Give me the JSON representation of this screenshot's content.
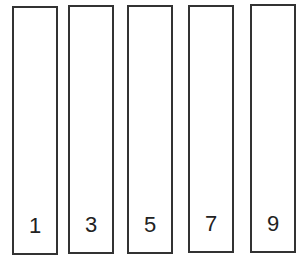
{
  "diagram": {
    "boxes": [
      {
        "label": "1"
      },
      {
        "label": "3"
      },
      {
        "label": "5"
      },
      {
        "label": "7"
      },
      {
        "label": "9"
      }
    ],
    "colors": {
      "stroke": "#333333",
      "fill": "#ffffff",
      "text": "#222222"
    }
  }
}
